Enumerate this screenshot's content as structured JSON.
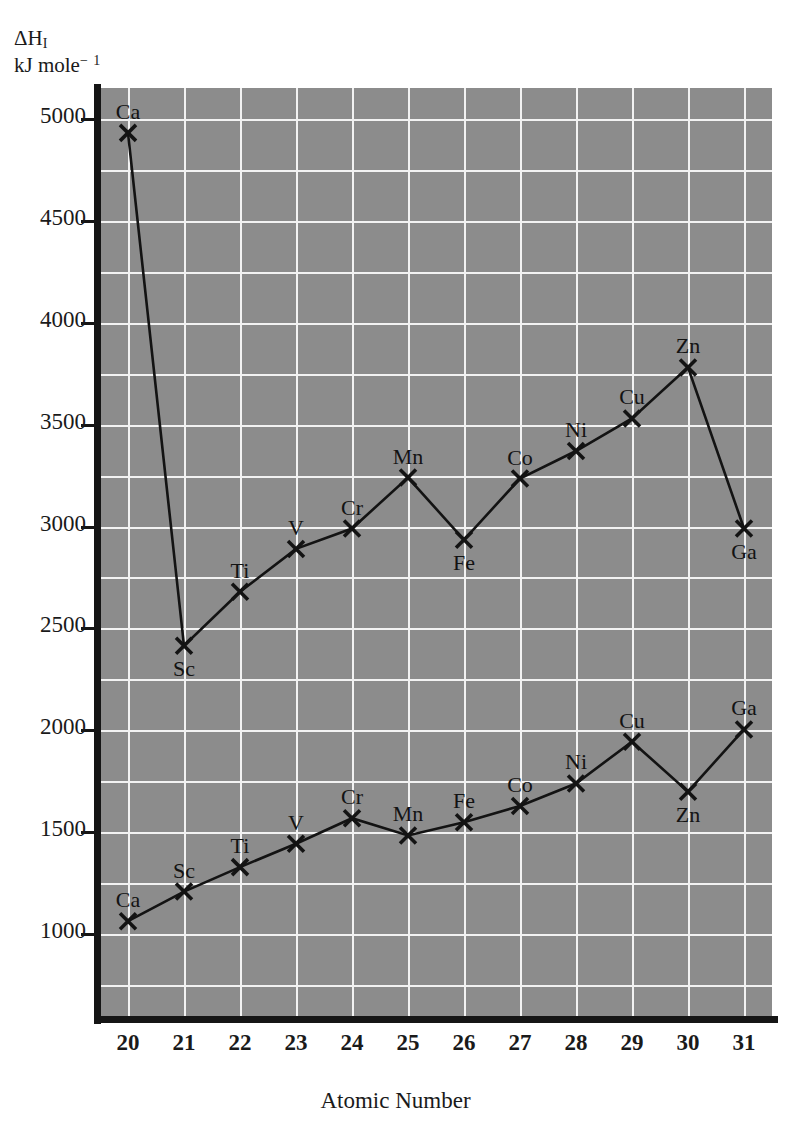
{
  "figure": {
    "y_axis_caption_line1": "ΔH",
    "y_axis_caption_line1_sub": "I",
    "y_axis_caption_line2": "kJ mole",
    "y_axis_caption_line2_sup": "− 1",
    "x_axis_title": "Atomic Number",
    "plot_background_color": "#8c8c8c",
    "gridline_color": "#f2f2f2",
    "axis_color": "#151515",
    "series_color": "#131313"
  },
  "chart_data": {
    "type": "line",
    "title": "",
    "xlabel": "Atomic Number",
    "ylabel": "ΔH_I kJ mole⁻¹",
    "xlim": [
      19.5,
      31.5
    ],
    "ylim": [
      600,
      5150
    ],
    "xticks": [
      20,
      21,
      22,
      23,
      24,
      25,
      26,
      27,
      28,
      29,
      30,
      31
    ],
    "xtick_labels": [
      "20",
      "21",
      "22",
      "23",
      "24",
      "25",
      "26",
      "27",
      "28",
      "29",
      "30",
      "31"
    ],
    "yticks": [
      1000,
      1500,
      2000,
      2500,
      3000,
      3500,
      4000,
      4500,
      5000
    ],
    "ytick_labels": [
      "1000",
      "1500",
      "2000",
      "2500",
      "3000",
      "3500",
      "4000",
      "4500",
      "5000"
    ],
    "y_minor_step": 250,
    "grid": true,
    "legend": "none",
    "x": [
      20,
      21,
      22,
      23,
      24,
      25,
      26,
      27,
      28,
      29,
      30,
      31
    ],
    "point_labels": [
      "Ca",
      "Sc",
      "Ti",
      "V",
      "Cr",
      "Mn",
      "Fe",
      "Co",
      "Ni",
      "Cu",
      "Zn",
      "Ga"
    ],
    "series": [
      {
        "name": "Second ionisation enthalpy",
        "values": [
          4930,
          2415,
          2680,
          2890,
          2990,
          3240,
          2935,
          3235,
          3370,
          3530,
          3780,
          2990
        ],
        "label_positions": [
          "above",
          "below",
          "above",
          "above",
          "above",
          "above",
          "below",
          "above",
          "above",
          "above",
          "above",
          "below"
        ]
      },
      {
        "name": "First ionisation enthalpy",
        "values": [
          1065,
          1210,
          1330,
          1445,
          1570,
          1485,
          1550,
          1630,
          1740,
          1945,
          1700,
          2005
        ],
        "label_positions": [
          "above",
          "above",
          "above",
          "above",
          "above",
          "above",
          "above",
          "above",
          "above",
          "above",
          "below",
          "above"
        ]
      }
    ]
  }
}
